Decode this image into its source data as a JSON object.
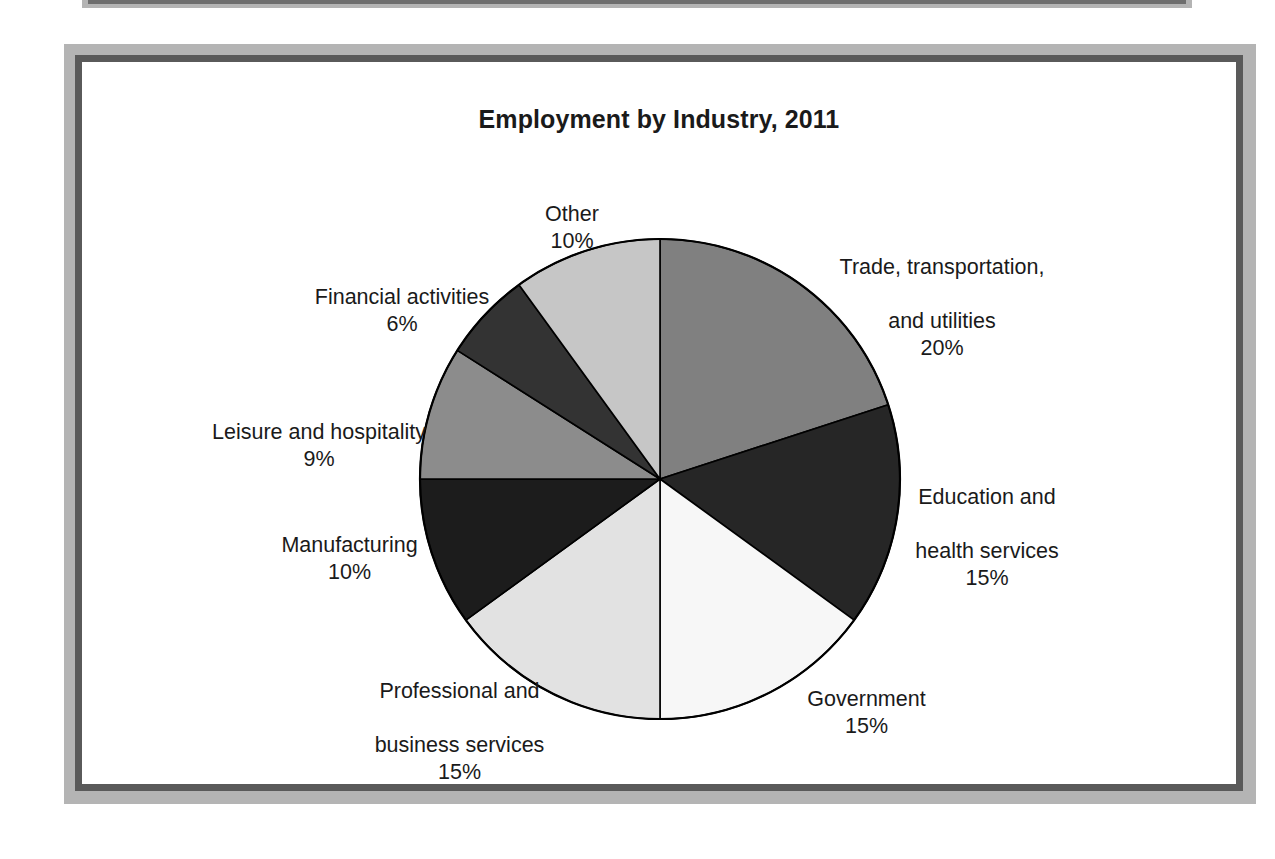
{
  "figure": {
    "title": "Employment by Industry, 2011",
    "frame_outer_color": "#b4b4b4",
    "frame_inner_color": "#5a5a5a",
    "background_color": "#ffffff"
  },
  "chart_data": {
    "type": "pie",
    "title": "Employment by Industry, 2011",
    "xlabel": "",
    "ylabel": "",
    "legend_position": "none",
    "grid": false,
    "unit": "%",
    "start_angle_deg": 0,
    "direction": "clockwise",
    "categories": [
      "Trade, transportation, and utilities",
      "Education and health services",
      "Government",
      "Professional and business services",
      "Manufacturing",
      "Leisure and hospitality",
      "Financial activities",
      "Other"
    ],
    "values": [
      20,
      15,
      15,
      15,
      10,
      9,
      6,
      10
    ],
    "colors": [
      "#808080",
      "#262626",
      "#f7f7f7",
      "#e2e2e2",
      "#1c1c1c",
      "#8c8c8c",
      "#333333",
      "#c6c6c6"
    ],
    "slices": [
      {
        "name": "Trade, transportation, and utilities",
        "label_line1": "Trade, transportation,",
        "label_line2": "and utilities",
        "value": 20,
        "pct_label": "20%",
        "color": "#808080"
      },
      {
        "name": "Education and health services",
        "label_line1": "Education and",
        "label_line2": "health services",
        "value": 15,
        "pct_label": "15%",
        "color": "#262626"
      },
      {
        "name": "Government",
        "label_line1": "Government",
        "label_line2": "",
        "value": 15,
        "pct_label": "15%",
        "color": "#f7f7f7"
      },
      {
        "name": "Professional and business services",
        "label_line1": "Professional and",
        "label_line2": "business services",
        "value": 15,
        "pct_label": "15%",
        "color": "#e2e2e2"
      },
      {
        "name": "Manufacturing",
        "label_line1": "Manufacturing",
        "label_line2": "",
        "value": 10,
        "pct_label": "10%",
        "color": "#1c1c1c"
      },
      {
        "name": "Leisure and hospitality",
        "label_line1": "Leisure and hospitality",
        "label_line2": "",
        "value": 9,
        "pct_label": "9%",
        "color": "#8c8c8c"
      },
      {
        "name": "Financial activities",
        "label_line1": "Financial activities",
        "label_line2": "",
        "value": 6,
        "pct_label": "6%",
        "color": "#333333"
      },
      {
        "name": "Other",
        "label_line1": "Other",
        "label_line2": "",
        "value": 10,
        "pct_label": "10%",
        "color": "#c6c6c6"
      }
    ]
  }
}
